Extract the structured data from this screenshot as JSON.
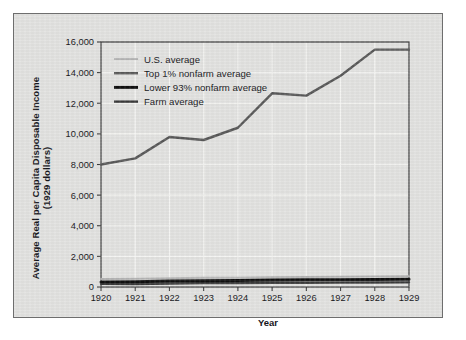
{
  "chart_data": {
    "type": "line",
    "title": "",
    "xlabel": "Year",
    "ylabel": "Average Real per Capita Disposable Income (1929 dollars)",
    "ylabel_line1": "Average Real per Capita Disposable Income",
    "ylabel_line2": "(1929 dollars)",
    "categories": [
      "1920",
      "1921",
      "1922",
      "1923",
      "1924",
      "1925",
      "1926",
      "1927",
      "1928",
      "1929"
    ],
    "x": [
      1920,
      1921,
      1922,
      1923,
      1924,
      1925,
      1926,
      1927,
      1928,
      1929
    ],
    "ylim": [
      0,
      16000
    ],
    "ytick_values": [
      0,
      2000,
      4000,
      6000,
      8000,
      10000,
      12000,
      14000,
      16000
    ],
    "ytick_labels": [
      "0",
      "2,000",
      "4,000",
      "6,000",
      "8,000",
      "10,000",
      "12,000",
      "14,000",
      "16,000"
    ],
    "grid": true,
    "grid_color": "#f2f2f0",
    "legend_position": "top-left inside plot",
    "series": [
      {
        "name": "U.S. average",
        "color": "#b4b4b4",
        "width": 2.0,
        "values": [
          520,
          540,
          575,
          610,
          600,
          640,
          660,
          665,
          680,
          700
        ]
      },
      {
        "name": "Top 1% nonfarm average",
        "color": "#585858",
        "width": 2.4,
        "values": [
          8000,
          8400,
          9800,
          9600,
          10400,
          12650,
          12500,
          13800,
          15500,
          15500
        ]
      },
      {
        "name": "Lower 93% nonfarm average",
        "color": "#101010",
        "width": 3.0,
        "values": [
          330,
          350,
          385,
          410,
          420,
          450,
          470,
          480,
          495,
          510
        ]
      },
      {
        "name": "Farm average",
        "color": "#3a3a3a",
        "width": 2.4,
        "values": [
          210,
          200,
          225,
          250,
          255,
          275,
          280,
          285,
          295,
          305
        ]
      }
    ]
  },
  "axes": {
    "plot_left": 100,
    "plot_right": 408,
    "plot_top": 41,
    "plot_bottom": 286,
    "frame_color": "#3d3d3d",
    "background": "#e2e2e0"
  }
}
